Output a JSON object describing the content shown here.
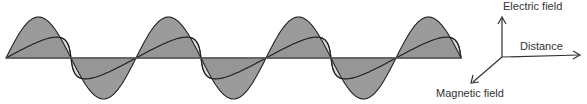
{
  "diagram": {
    "axes": {
      "electric": "Electric field",
      "distance": "Distance",
      "magnetic": "Magnetic field"
    },
    "wave": {
      "start_x": 6,
      "axis_y": 58,
      "period_px": 130,
      "cycles": 3.5,
      "electric_amplitude_px": 41,
      "magnetic_amplitude_px": 22,
      "electric_fill": "#8a8a8a",
      "magnetic_fill": "#d9d9d9",
      "stroke": "#222222"
    }
  }
}
